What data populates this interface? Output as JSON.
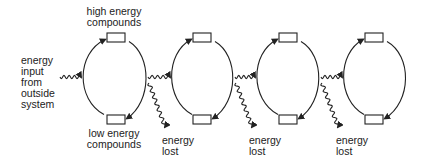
{
  "labels": {
    "high_energy": [
      "high energy",
      "compounds"
    ],
    "low_energy": [
      "low energy",
      "compounds"
    ],
    "energy_input": [
      "energy",
      "input",
      "from",
      "outside",
      "system"
    ],
    "energy_lost": [
      "energy",
      "lost"
    ]
  },
  "cycles": [
    {
      "cx": 114,
      "box_top_x": 107,
      "left": 82,
      "right": 146
    },
    {
      "cx": 202,
      "box_top_x": 193,
      "left": 171,
      "right": 233
    },
    {
      "cx": 288,
      "box_top_x": 279,
      "left": 256,
      "right": 319
    },
    {
      "cx": 374,
      "box_top_x": 365,
      "left": 343,
      "right": 406
    }
  ],
  "energy_lost_count": 3,
  "colors": {
    "stroke": "#222222",
    "background": "#ffffff"
  }
}
